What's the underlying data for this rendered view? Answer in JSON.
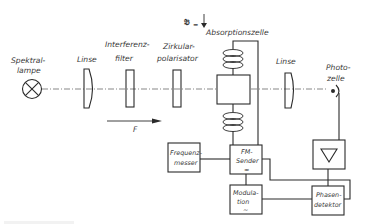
{
  "diagram": {
    "components": {
      "lamp": {
        "label_line1": "Spektral-",
        "label_line2": "lampe"
      },
      "lens1": {
        "label": "Linse"
      },
      "filter": {
        "label_line1": "Interferenz-",
        "label_line2": "filter"
      },
      "polarizer": {
        "label_line1": "Zirkular-",
        "label_line2": "polarisator"
      },
      "field": {
        "label": "𝔅",
        "subscript": "="
      },
      "cell": {
        "label": "Absorptionszelle"
      },
      "lens2": {
        "label": "Linse"
      },
      "photocell": {
        "label_line1": "Photo-",
        "label_line2": "zelle"
      },
      "light_direction": {
        "label": "F"
      },
      "frequency_meter": {
        "label_line1": "Frequenz-",
        "label_line2": "messer"
      },
      "fm_sender": {
        "label_line1": "FM-",
        "label_line2": "Sender",
        "symbol": "≈"
      },
      "modulation": {
        "label_line1": "Modula-",
        "label_line2": "tion",
        "symbol": "~"
      },
      "amplifier": {
        "symbol": "▽"
      },
      "phase_detector": {
        "label_line1": "Phasen-",
        "label_line2": "detektor"
      }
    },
    "colors": {
      "line": "#2a2a2a",
      "text": "#3a3a3a",
      "background": "#ffffff"
    }
  }
}
